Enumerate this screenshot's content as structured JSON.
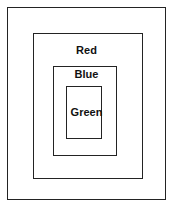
{
  "diagram": {
    "type": "nested-boxes",
    "background_color": "#ffffff",
    "stroke_color": "#232323",
    "text_color": "#111111",
    "boxes": [
      {
        "name": "outer",
        "label": "",
        "x": 7,
        "y": 7,
        "width": 159,
        "height": 193,
        "stroke": "#232323",
        "fill": "none"
      },
      {
        "name": "red",
        "label": "Red",
        "x": 33,
        "y": 33,
        "width": 110,
        "height": 146,
        "stroke": "#232323",
        "fill": "none"
      },
      {
        "name": "blue",
        "label": "Blue",
        "x": 53,
        "y": 66,
        "width": 64,
        "height": 90,
        "stroke": "#232323",
        "fill": "none"
      },
      {
        "name": "green",
        "label": "Green",
        "x": 66,
        "y": 86,
        "width": 36,
        "height": 53,
        "stroke": "#232323",
        "fill": "none"
      }
    ],
    "labels": {
      "red": "Red",
      "blue": "Blue",
      "green": "Green"
    }
  }
}
